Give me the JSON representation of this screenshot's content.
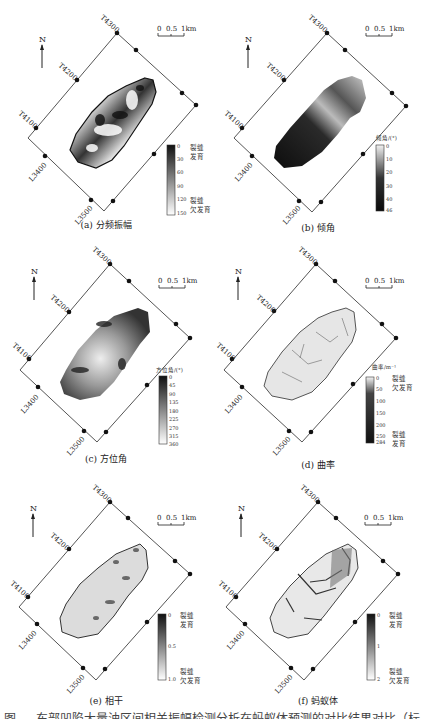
{
  "figure": {
    "caption_partial": "图 … 东部凹陷大量油区间相关振幅检测分析在蚂蚁体预测的对比结果对比（标题被截断）",
    "north_label": "N",
    "scale_bar": {
      "ticks": [
        "0",
        "0.5",
        "1km"
      ]
    },
    "trace_labels": [
      "T4300",
      "T4200",
      "T4100"
    ],
    "line_labels": [
      "L3400",
      "L3500"
    ]
  },
  "panels": [
    {
      "id": "a",
      "caption": "(a) 分频振幅",
      "legend": {
        "title": "",
        "ticks": [
          "0",
          "30",
          "60",
          "90",
          "120",
          "150"
        ],
        "top_label": [
          "裂缝",
          "发育"
        ],
        "bottom_label": [
          "裂缝",
          "欠发育"
        ],
        "gradient": [
          "#111111",
          "#ffffff"
        ]
      },
      "map_style": "high-contrast mottled"
    },
    {
      "id": "b",
      "caption": "(b) 倾角",
      "legend": {
        "title": "倾角/(°)",
        "ticks": [
          "0",
          "10",
          "20",
          "30",
          "40",
          "46"
        ],
        "top_label": [],
        "bottom_label": [],
        "gradient": [
          "#f2f2f2",
          "#0a0a0a"
        ]
      },
      "map_style": "dark with light NE band"
    },
    {
      "id": "c",
      "caption": "(c) 方位角",
      "legend": {
        "title": "方位角/(°)",
        "ticks": [
          "0",
          "45",
          "90",
          "135",
          "180",
          "225",
          "270",
          "315",
          "360"
        ],
        "top_label": [],
        "bottom_label": [],
        "gradient": [
          "#111111",
          "#ffffff"
        ]
      },
      "map_style": "grey patchy"
    },
    {
      "id": "d",
      "caption": "(d) 曲率",
      "legend": {
        "title": "曲率/m⁻¹",
        "ticks": [
          "0",
          "50",
          "100",
          "150",
          "200",
          "250",
          "284"
        ],
        "top_label": [
          "裂缝",
          "欠发育"
        ],
        "bottom_label": [
          "裂缝",
          "发育"
        ],
        "gradient": [
          "#f5f5f5",
          "#111111"
        ]
      },
      "map_style": "light with fine lines"
    },
    {
      "id": "e",
      "caption": "(e) 相干",
      "legend": {
        "title": "",
        "ticks": [
          "0",
          "0.5",
          "1.0"
        ],
        "top_label": [
          "裂缝",
          "发育"
        ],
        "bottom_label": [
          "裂缝",
          "欠发育"
        ],
        "gradient": [
          "#111111",
          "#ffffff"
        ]
      },
      "map_style": "light with dark spots"
    },
    {
      "id": "f",
      "caption": "(f) 蚂蚁体",
      "legend": {
        "title": "",
        "ticks": [
          "0",
          "1",
          "2"
        ],
        "top_label": [
          "裂缝",
          "发育"
        ],
        "bottom_label": [
          "裂缝",
          "欠发育"
        ],
        "gradient": [
          "#111111",
          "#ffffff"
        ]
      },
      "map_style": "light with dark linear traces"
    }
  ]
}
